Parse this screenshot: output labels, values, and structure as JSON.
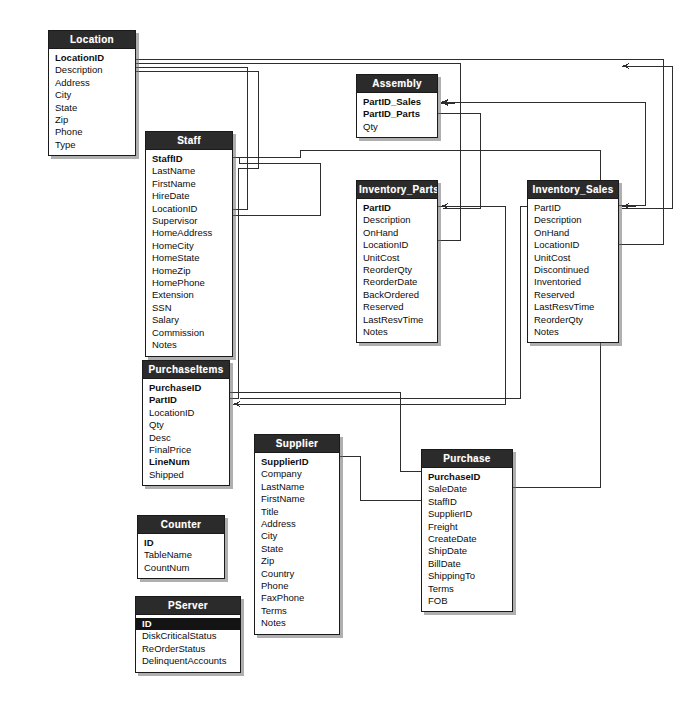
{
  "diagram": {
    "kind": "entity-relationship-diagram",
    "background_color": "#ffffff",
    "header_color": "#2b2b2b",
    "header_text_color": "#ffffff",
    "body_color": "#ffffff",
    "line_color": "#2e2e2e",
    "shadow_color": "#6e6e6e"
  },
  "tables": [
    {
      "id": "location",
      "name": "Location",
      "x": 48,
      "y": 30,
      "w": 88,
      "fields": [
        {
          "label": "LocationID",
          "key": true
        },
        {
          "label": "Description",
          "key": false
        },
        {
          "label": "Address",
          "key": false
        },
        {
          "label": "City",
          "key": false
        },
        {
          "label": "State",
          "key": false
        },
        {
          "label": "Zip",
          "key": false
        },
        {
          "label": "Phone",
          "key": false
        },
        {
          "label": "Type",
          "key": false
        }
      ]
    },
    {
      "id": "staff",
      "name": "Staff",
      "x": 145,
      "y": 131,
      "w": 88,
      "fields": [
        {
          "label": "StaffID",
          "key": true
        },
        {
          "label": "LastName",
          "key": false
        },
        {
          "label": "FirstName",
          "key": false
        },
        {
          "label": "HireDate",
          "key": false
        },
        {
          "label": "LocationID",
          "key": false
        },
        {
          "label": "Supervisor",
          "key": false
        },
        {
          "label": "HomeAddress",
          "key": false
        },
        {
          "label": "HomeCity",
          "key": false
        },
        {
          "label": "HomeState",
          "key": false
        },
        {
          "label": "HomeZip",
          "key": false
        },
        {
          "label": "HomePhone",
          "key": false
        },
        {
          "label": "Extension",
          "key": false
        },
        {
          "label": "SSN",
          "key": false
        },
        {
          "label": "Salary",
          "key": false
        },
        {
          "label": "Commission",
          "key": false
        },
        {
          "label": "Notes",
          "key": false
        }
      ]
    },
    {
      "id": "assembly",
      "name": "Assembly",
      "x": 356,
      "y": 74,
      "w": 82,
      "fields": [
        {
          "label": "PartID_Sales",
          "key": true
        },
        {
          "label": "PartID_Parts",
          "key": true
        },
        {
          "label": "Qty",
          "key": false
        }
      ]
    },
    {
      "id": "inventory_parts",
      "name": "Inventory_Parts",
      "x": 356,
      "y": 180,
      "w": 82,
      "fields": [
        {
          "label": "PartID",
          "key": true
        },
        {
          "label": "Description",
          "key": false
        },
        {
          "label": "OnHand",
          "key": false
        },
        {
          "label": "LocationID",
          "key": false
        },
        {
          "label": "UnitCost",
          "key": false
        },
        {
          "label": "ReorderQty",
          "key": false
        },
        {
          "label": "ReorderDate",
          "key": false
        },
        {
          "label": "BackOrdered",
          "key": false
        },
        {
          "label": "Reserved",
          "key": false
        },
        {
          "label": "LastResvTime",
          "key": false
        },
        {
          "label": "Notes",
          "key": false
        }
      ]
    },
    {
      "id": "inventory_sales",
      "name": "Inventory_Sales",
      "x": 527,
      "y": 180,
      "w": 92,
      "fields": [
        {
          "label": "PartID",
          "key": false
        },
        {
          "label": "Description",
          "key": false
        },
        {
          "label": "OnHand",
          "key": false
        },
        {
          "label": "LocationID",
          "key": false
        },
        {
          "label": "UnitCost",
          "key": false
        },
        {
          "label": "Discontinued",
          "key": false
        },
        {
          "label": "Inventoried",
          "key": false
        },
        {
          "label": "Reserved",
          "key": false
        },
        {
          "label": "LastResvTime",
          "key": false
        },
        {
          "label": "ReorderQty",
          "key": false
        },
        {
          "label": "Notes",
          "key": false
        }
      ]
    },
    {
      "id": "purchaseitems",
      "name": "PurchaseItems",
      "x": 142,
      "y": 360,
      "w": 88,
      "fields": [
        {
          "label": "PurchaseID",
          "key": true
        },
        {
          "label": "PartID",
          "key": true
        },
        {
          "label": "LocationID",
          "key": false
        },
        {
          "label": "Qty",
          "key": false
        },
        {
          "label": "Desc",
          "key": false
        },
        {
          "label": "FinalPrice",
          "key": false
        },
        {
          "label": "LineNum",
          "key": true
        },
        {
          "label": "Shipped",
          "key": false
        }
      ]
    },
    {
      "id": "supplier",
      "name": "Supplier",
      "x": 254,
      "y": 434,
      "w": 86,
      "fields": [
        {
          "label": "SupplierID",
          "key": true
        },
        {
          "label": "Company",
          "key": false
        },
        {
          "label": "LastName",
          "key": false
        },
        {
          "label": "FirstName",
          "key": false
        },
        {
          "label": "Title",
          "key": false
        },
        {
          "label": "Address",
          "key": false
        },
        {
          "label": "City",
          "key": false
        },
        {
          "label": "State",
          "key": false
        },
        {
          "label": "Zip",
          "key": false
        },
        {
          "label": "Country",
          "key": false
        },
        {
          "label": "Phone",
          "key": false
        },
        {
          "label": "FaxPhone",
          "key": false
        },
        {
          "label": "Terms",
          "key": false
        },
        {
          "label": "Notes",
          "key": false
        }
      ]
    },
    {
      "id": "purchase",
      "name": "Purchase",
      "x": 421,
      "y": 449,
      "w": 92,
      "fields": [
        {
          "label": "PurchaseID",
          "key": true
        },
        {
          "label": "SaleDate",
          "key": false
        },
        {
          "label": "StaffID",
          "key": false
        },
        {
          "label": "SupplierID",
          "key": false
        },
        {
          "label": "Freight",
          "key": false
        },
        {
          "label": "CreateDate",
          "key": false
        },
        {
          "label": "ShipDate",
          "key": false
        },
        {
          "label": "BillDate",
          "key": false
        },
        {
          "label": "ShippingTo",
          "key": false
        },
        {
          "label": "Terms",
          "key": false
        },
        {
          "label": "FOB",
          "key": false
        }
      ]
    },
    {
      "id": "counter",
      "name": "Counter",
      "x": 137,
      "y": 515,
      "w": 88,
      "fields": [
        {
          "label": "ID",
          "key": true
        },
        {
          "label": "TableName",
          "key": false
        },
        {
          "label": "CountNum",
          "key": false
        }
      ]
    },
    {
      "id": "pserver",
      "name": "PServer",
      "x": 135,
      "y": 596,
      "w": 106,
      "fields": [
        {
          "label": "ID",
          "key": true,
          "selected": true
        },
        {
          "label": "DiskCriticalStatus",
          "key": false
        },
        {
          "label": "ReOrderStatus",
          "key": false
        },
        {
          "label": "DelinquentAccounts",
          "key": false
        }
      ]
    }
  ],
  "relationships": [
    {
      "from": "Location.LocationID",
      "to": "Staff.LocationID"
    },
    {
      "from": "Location.LocationID",
      "to": "Inventory_Parts.LocationID"
    },
    {
      "from": "Location.LocationID",
      "to": "Inventory_Sales.LocationID"
    },
    {
      "from": "Location.LocationID",
      "to": "PurchaseItems.LocationID"
    },
    {
      "from": "Staff.StaffID",
      "to": "Purchase.StaffID"
    },
    {
      "from": "Staff.Supervisor",
      "to": "Staff.StaffID"
    },
    {
      "from": "Inventory_Sales.PartID",
      "to": "Assembly.PartID_Sales"
    },
    {
      "from": "Inventory_Parts.PartID",
      "to": "Assembly.PartID_Parts"
    },
    {
      "from": "Inventory_Parts.PartID",
      "to": "PurchaseItems.PartID"
    },
    {
      "from": "Inventory_Sales.PartID",
      "to": "PurchaseItems.PartID"
    },
    {
      "from": "Supplier.SupplierID",
      "to": "Purchase.SupplierID"
    },
    {
      "from": "Purchase.PurchaseID",
      "to": "PurchaseItems.PurchaseID"
    }
  ]
}
